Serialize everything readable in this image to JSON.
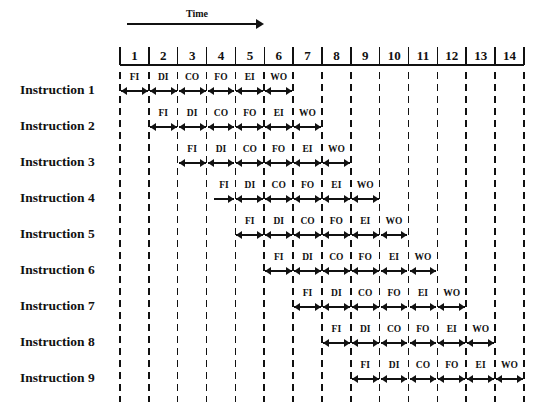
{
  "axis": {
    "time_label": "Time",
    "columns": [
      "1",
      "2",
      "3",
      "4",
      "5",
      "6",
      "7",
      "8",
      "9",
      "10",
      "11",
      "12",
      "13",
      "14"
    ]
  },
  "stages": [
    "FI",
    "DI",
    "CO",
    "FO",
    "EI",
    "WO"
  ],
  "instructions": [
    {
      "label": "Instruction 1",
      "start_col": 1
    },
    {
      "label": "Instruction 2",
      "start_col": 2
    },
    {
      "label": "Instruction 3",
      "start_col": 3
    },
    {
      "label": "Instruction 4",
      "start_col": 4
    },
    {
      "label": "Instruction 5",
      "start_col": 5
    },
    {
      "label": "Instruction 6",
      "start_col": 6
    },
    {
      "label": "Instruction 7",
      "start_col": 7
    },
    {
      "label": "Instruction 8",
      "start_col": 8
    },
    {
      "label": "Instruction 9",
      "start_col": 9
    }
  ]
}
